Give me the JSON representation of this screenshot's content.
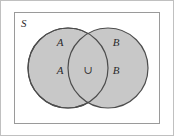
{
  "figure": {
    "kind": "venn-diagram",
    "canvas": {
      "width": 174,
      "height": 136
    },
    "background_color": "#ffffff",
    "outer_edge_color": "#c0c0c0"
  },
  "universe": {
    "label": "S",
    "border_color": "#9a9a9a",
    "fill_color": "#ffffff",
    "x": 14,
    "y": 12,
    "width": 146,
    "height": 112,
    "label_x": 21,
    "label_y": 27
  },
  "circles": [
    {
      "name": "set-a",
      "cx": 68,
      "cy": 68,
      "r": 40,
      "fill_color": "#c8c8c8",
      "stroke_color": "#4d4d4d"
    },
    {
      "name": "set-b",
      "cx": 108,
      "cy": 68,
      "r": 40,
      "fill_color": "#c8c8c8",
      "stroke_color": "#4d4d4d"
    }
  ],
  "labels": [
    {
      "name": "label-a-top",
      "text": "A",
      "x": 60,
      "y": 46
    },
    {
      "name": "label-a-bottom",
      "text": "A",
      "x": 60,
      "y": 74
    },
    {
      "name": "label-b-top",
      "text": "B",
      "x": 116,
      "y": 46
    },
    {
      "name": "label-b-bottom",
      "text": "B",
      "x": 116,
      "y": 74
    }
  ],
  "operator": {
    "name": "union-symbol",
    "text": "∪",
    "x": 88,
    "y": 74
  },
  "chart_data": {
    "type": "table",
    "categories": [
      "S",
      "A",
      "B",
      "A ∪ B"
    ],
    "values": [
      {
        "region": "S",
        "description": "universal set rectangle",
        "label": "S"
      },
      {
        "region": "A",
        "description": "left shaded circle",
        "label": "A"
      },
      {
        "region": "B",
        "description": "right shaded circle",
        "label": "B"
      },
      {
        "region": "A ∪ B",
        "description": "overlapping lens, marked with union symbol",
        "label": "∪"
      }
    ],
    "xlabel": "",
    "ylabel": "",
    "grid": false,
    "legend": "none"
  }
}
